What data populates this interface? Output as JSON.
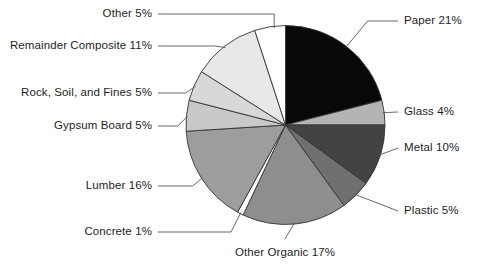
{
  "chart_data": {
    "type": "pie",
    "title": "",
    "subtitle": "",
    "xlabel": "",
    "ylabel": "",
    "legend_position": "callout-labels",
    "grid": false,
    "units": "percent",
    "start_angle_deg": 0,
    "direction": "clockwise",
    "categories": [
      "Paper",
      "Glass",
      "Metal",
      "Plastic",
      "Other Organic",
      "Concrete",
      "Lumber",
      "Gypsum Board",
      "Rock, Soil, and Fines",
      "Remainder Composite",
      "Other"
    ],
    "values": [
      21,
      4,
      10,
      5,
      17,
      1,
      16,
      5,
      5,
      11,
      5
    ],
    "labels": [
      "Paper 21%",
      "Glass 4%",
      "Metal 10%",
      "Plastic 5%",
      "Other Organic 17%",
      "Concrete 1%",
      "Lumber 16%",
      "Gypsum Board 5%",
      "Rock, Soil, and Fines 5%",
      "Remainder Composite 11%",
      "Other 5%"
    ],
    "colors": [
      "#080808",
      "#b4b4b4",
      "#434343",
      "#707070",
      "#8e8e8e",
      "#ffffff",
      "#9d9d9d",
      "#c9c9c9",
      "#d8d8d8",
      "#e8e8e8",
      "#ffffff"
    ],
    "slice_outline_color": "#333333",
    "callout_line_color": "#555555",
    "text_color": "#1d1d1d"
  },
  "geometry": {
    "center_x": 285.5,
    "center_y": 125.0,
    "radius": 99.5
  },
  "callouts": [
    {
      "key": "paper",
      "text": "Paper 21%",
      "side": "right",
      "x": 404,
      "y": 21
    },
    {
      "key": "glass",
      "text": "Glass 4%",
      "side": "right",
      "x": 404,
      "y": 112
    },
    {
      "key": "metal",
      "text": "Metal 10%",
      "side": "right",
      "x": 404,
      "y": 148
    },
    {
      "key": "plastic",
      "text": "Plastic 5%",
      "side": "right",
      "x": 404,
      "y": 211
    },
    {
      "key": "organic",
      "text": "Other Organic 17%",
      "side": "bottom",
      "x": 285,
      "y": 253
    },
    {
      "key": "concrete",
      "text": "Concrete 1%",
      "side": "left",
      "x": 152,
      "y": 232
    },
    {
      "key": "lumber",
      "text": "Lumber 16%",
      "side": "left",
      "x": 152,
      "y": 186
    },
    {
      "key": "gypsum",
      "text": "Gypsum Board 5%",
      "side": "left",
      "x": 152,
      "y": 126
    },
    {
      "key": "rock",
      "text": "Rock, Soil, and Fines 5%",
      "side": "left",
      "x": 152,
      "y": 93
    },
    {
      "key": "remainder",
      "text": "Remainder Composite 11%",
      "side": "left",
      "x": 152,
      "y": 46
    },
    {
      "key": "other",
      "text": "Other 5%",
      "side": "left",
      "x": 152,
      "y": 14
    }
  ]
}
